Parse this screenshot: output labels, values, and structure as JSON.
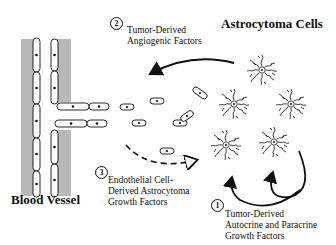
{
  "titles": {
    "astrocytoma": "Astrocytoma Cells",
    "vessel": "Blood Vessel"
  },
  "labels": [
    {
      "number": "2",
      "line1": "Tumor-Derived",
      "line2": "Angiogenic Factors"
    },
    {
      "number": "3",
      "line1": "Endothelial Cell-",
      "line2": "Derived Astrocytoma",
      "line3": "Growth Factors"
    },
    {
      "number": "1",
      "line1": "Tumor-Derived",
      "line2": "Autocrine and Paracrine",
      "line3": "Growth Factors"
    }
  ],
  "colors": {
    "vessel_wall": "#b8b8b8",
    "line": "#111111"
  }
}
